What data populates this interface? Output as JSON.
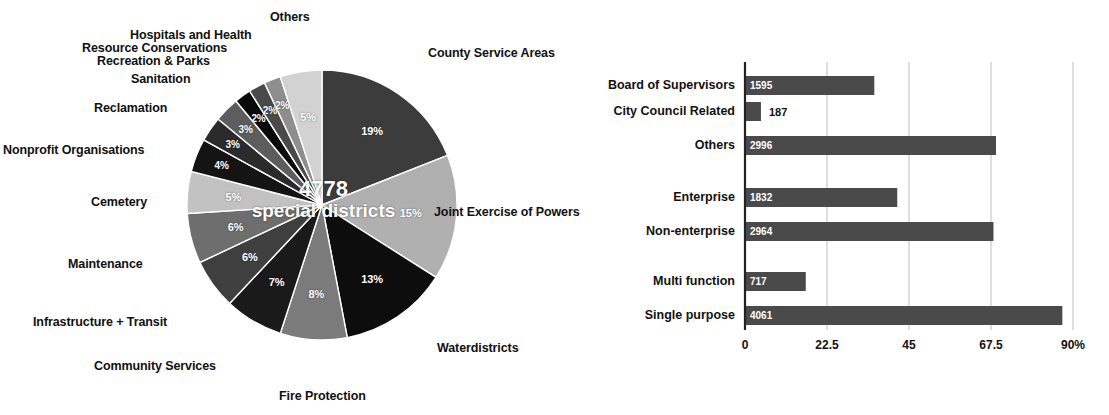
{
  "chart_data": [
    {
      "type": "pie",
      "title": "California Special Districts by Type",
      "center_value": "4778",
      "center_label": "special districts",
      "total": 4778,
      "grid": false,
      "legend": "callout-labels",
      "categories": [
        "County Service Areas",
        "Joint Exercise of Powers",
        "Waterdistricts",
        "Fire Protection",
        "Community Services",
        "Infrastructure + Transit",
        "Maintenance",
        "Cemetery",
        "Nonprofit Organisations",
        "Reclamation",
        "Sanitation",
        "Recreation & Parks",
        "Resource Conservations",
        "Hospitals and Health",
        "Others"
      ],
      "values": [
        19,
        15,
        13,
        8,
        7,
        6,
        6,
        5,
        4,
        3,
        3,
        2,
        2,
        2,
        5
      ],
      "value_labels": [
        "19%",
        "15%",
        "13%",
        "8%",
        "7%",
        "6%",
        "6%",
        "5%",
        "4%",
        "3%",
        "3%",
        "2%",
        "2%",
        "2%",
        "5%"
      ],
      "slice_colors": [
        "#3c3c3c",
        "#b0b0b0",
        "#0d0d0d",
        "#7b7b7b",
        "#1a1a1a",
        "#3f3f3f",
        "#6e6e6e",
        "#c2c2c2",
        "#141414",
        "#2b2b2b",
        "#5d5d5d",
        "#0a0a0a",
        "#4a4a4a",
        "#8e8e8e",
        "#d2d2d2"
      ]
    },
    {
      "type": "bar",
      "orientation": "horizontal",
      "title": "Special Districts by Governance / Function",
      "xlabel": "",
      "ylabel": "",
      "xlim": [
        0,
        90
      ],
      "tick_labels": [
        "0",
        "22.5",
        "45",
        "67.5",
        "90%"
      ],
      "tick_values": [
        0,
        22.5,
        45,
        67.5,
        90
      ],
      "grid": true,
      "bar_color": "#4a4a4a",
      "categories": [
        "Board of Supervisors",
        "City Council Related",
        "Others",
        "Enterprise",
        "Non-enterprise",
        "Multi function",
        "Single purpose"
      ],
      "count_labels": [
        "1595",
        "187",
        "2996",
        "1832",
        "2964",
        "717",
        "4061"
      ],
      "counts": [
        1595,
        187,
        2996,
        1832,
        2964,
        717,
        4061
      ],
      "values": [
        35.2,
        4.1,
        68.6,
        41.5,
        67.9,
        16.4,
        86.8
      ],
      "group_label": "Joint Exercise of Powers"
    }
  ],
  "pie": {
    "labels": [
      {
        "text": "Others",
        "x": 270,
        "y": 10,
        "align": "left"
      },
      {
        "text": "Hospitals and Health",
        "x": 130,
        "y": 28,
        "align": "left"
      },
      {
        "text": "Resource Conservations",
        "x": 82,
        "y": 41,
        "align": "left"
      },
      {
        "text": "Recreation & Parks",
        "x": 97,
        "y": 54,
        "align": "left"
      },
      {
        "text": "Sanitation",
        "x": 131,
        "y": 72,
        "align": "left"
      },
      {
        "text": "Reclamation",
        "x": 94,
        "y": 101,
        "align": "left"
      },
      {
        "text": "Nonprofit Organisations",
        "x": 3,
        "y": 143,
        "align": "left"
      },
      {
        "text": "Cemetery",
        "x": 91,
        "y": 195,
        "align": "left"
      },
      {
        "text": "Maintenance",
        "x": 68,
        "y": 257,
        "align": "left"
      },
      {
        "text": "Infrastructure + Transit",
        "x": 33,
        "y": 315,
        "align": "left"
      },
      {
        "text": "Community Services",
        "x": 94,
        "y": 359,
        "align": "left"
      },
      {
        "text": "Fire Protection",
        "x": 279,
        "y": 389,
        "align": "left"
      },
      {
        "text": "County Service Areas",
        "x": 428,
        "y": 46,
        "align": "left"
      },
      {
        "text": "Joint Exercise of Powers",
        "x": 434,
        "y": 205,
        "align": "left"
      },
      {
        "text": "Waterdistricts",
        "x": 437,
        "y": 341,
        "align": "left"
      }
    ],
    "center_value": "4778",
    "center_label": "special districts"
  }
}
